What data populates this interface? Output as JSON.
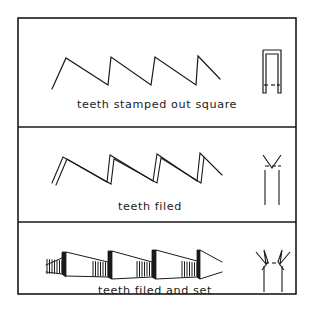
{
  "figure": {
    "background_color": "#ffffff",
    "ink_color": "#1a1a1a",
    "border": {
      "x": 18,
      "y": 18,
      "width": 278,
      "height": 276,
      "stroke_width": 1.6
    },
    "dividers": [
      {
        "name": "divider-1",
        "y": 127
      },
      {
        "name": "divider-2",
        "y": 222
      }
    ]
  },
  "panels": [
    {
      "id": "stamped",
      "caption": "teeth stamped out square",
      "caption_x": 157,
      "caption_y": 105,
      "profile": {
        "name": "sawtooth-profile-stamped",
        "style": "single-line",
        "points": "52,89 66,58 108,85 111,57 151,85 155,57 196,85 198,56 220,79",
        "stroke_width": 1.2
      },
      "end_view": {
        "name": "end-view-square",
        "description": "square stamped tooth end view: open rectangle with dashed base line",
        "outline": "263,50 281,50 281,93 278,93 278,54 266,54 266,93 263,93 263,50",
        "dashes": [
          {
            "x1": 264,
            "y1": 85,
            "x2": 268,
            "y2": 85
          },
          {
            "x1": 271,
            "y1": 85,
            "x2": 275,
            "y2": 85
          },
          {
            "x1": 277,
            "y1": 85,
            "x2": 280,
            "y2": 85
          }
        ],
        "stroke_width": 1.2
      }
    },
    {
      "id": "filed",
      "caption": "teeth filed",
      "caption_x": 150,
      "caption_y": 207,
      "profile": {
        "name": "sawtooth-profile-filed",
        "style": "double-line-bevel",
        "front_points": "52,183 63,157 107,182 110,155 153,181 157,154 197,181 200,153 222,175",
        "bevel_points": "56,185 67,159 111,184 114,159 157,183 161,158 201,183 204,157",
        "stroke_width": 1.1
      },
      "end_view": {
        "name": "end-view-filed",
        "description": "filed tooth end view: V notch between two uprights forming an M crown",
        "outline": "263,155 268,168 273,155 278,168 281,155 281,205 278,205 278,172 273,172 273,205 270,205 270,172 266,172 266,205 263,205 263,155",
        "crown": "263,155 272,168 281,155",
        "uprights": [
          {
            "x1": 265,
            "y1": 170,
            "x2": 265,
            "y2": 205
          },
          {
            "x1": 279,
            "y1": 170,
            "x2": 279,
            "y2": 205
          }
        ],
        "dashes": [
          {
            "x1": 265,
            "y1": 166,
            "x2": 269,
            "y2": 166
          },
          {
            "x1": 272,
            "y1": 166,
            "x2": 276,
            "y2": 166
          },
          {
            "x1": 278,
            "y1": 166,
            "x2": 281,
            "y2": 166
          }
        ],
        "stroke_width": 1.1
      }
    },
    {
      "id": "filed-and-set",
      "caption": "teeth filed and set",
      "caption_x": 155,
      "caption_y": 291,
      "profile": {
        "name": "sawtooth-profile-filed-and-set",
        "style": "three-dimensional-set",
        "top_edge": "46,265 62,258 66,252 108,262 112,251 152,262 156,250 197,261 200,250 222,262",
        "bottom_edge": "46,272 62,274 66,276 108,277 112,279 152,277 156,279 197,277 200,279 222,272",
        "set_blocks": [
          {
            "name": "set-block-1",
            "hatch_x_start": 47,
            "hatch_x_end": 62,
            "hatch_top": 259,
            "hatch_bottom": 274,
            "hatch_count": 7,
            "solid": "62,252 66,252 66,277 62,274"
          },
          {
            "name": "set-block-2",
            "hatch_x_start": 93,
            "hatch_x_end": 108,
            "hatch_top": 261,
            "hatch_bottom": 277,
            "hatch_count": 7,
            "solid": "108,251 112,251 112,279 108,277"
          },
          {
            "name": "set-block-3",
            "hatch_x_start": 137,
            "hatch_x_end": 152,
            "hatch_top": 261,
            "hatch_bottom": 277,
            "hatch_count": 7,
            "solid": "152,250 156,250 156,279 152,277"
          },
          {
            "name": "set-block-4",
            "hatch_x_start": 182,
            "hatch_x_end": 197,
            "hatch_top": 261,
            "hatch_bottom": 277,
            "hatch_count": 7,
            "solid": "197,250 200,250 200,279 197,277"
          }
        ],
        "stroke_width": 1.0
      },
      "end_view": {
        "name": "end-view-filed-and-set",
        "description": "set tooth end view: two outward-flaring barbed points on slender shanks",
        "left_barb": "256,252 266,264 264,250 268,262 262,270",
        "right_barb": "290,252 280,264 282,250 278,262 284,270",
        "shanks": [
          {
            "x1": 264,
            "y1": 266,
            "x2": 264,
            "y2": 292
          },
          {
            "x1": 282,
            "y1": 266,
            "x2": 282,
            "y2": 292
          }
        ],
        "dashes": [
          {
            "x1": 265,
            "y1": 263,
            "x2": 269,
            "y2": 263
          },
          {
            "x1": 272,
            "y1": 263,
            "x2": 276,
            "y2": 263
          }
        ],
        "stroke_width": 1.1
      }
    }
  ]
}
